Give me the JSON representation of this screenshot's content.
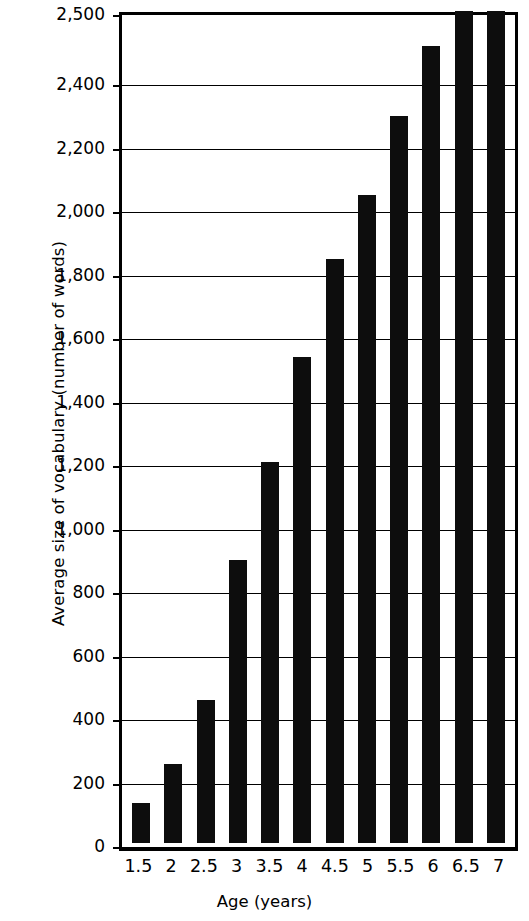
{
  "chart_data": {
    "type": "bar",
    "title": "",
    "subtitle": "",
    "xlabel": "Age (years)",
    "ylabel": "Average size of vocabulary (number of words)",
    "categories": [
      "1.5",
      "2",
      "2.5",
      "3",
      "3.5",
      "4",
      "4.5",
      "5",
      "5.5",
      "6",
      "6.5",
      "7"
    ],
    "values": [
      125,
      250,
      450,
      890,
      1200,
      1530,
      1840,
      2040,
      2290,
      2450,
      2500,
      2500
    ],
    "series": [
      {
        "name": "Average size of vocabulary",
        "values": [
          125,
          250,
          450,
          890,
          1200,
          1530,
          1840,
          2040,
          2290,
          2450,
          2500,
          2500
        ]
      }
    ],
    "ylim": [
      0,
      2500
    ],
    "xlim_note": "categorical",
    "ytick_labels": [
      "0",
      "200",
      "400",
      "600",
      "800",
      "1,000",
      "1,200",
      "1,400",
      "1,600",
      "1,800",
      "2,000",
      "2,200",
      "2,400",
      "2,500"
    ],
    "ytick_values": [
      0,
      200,
      400,
      600,
      800,
      1000,
      1200,
      1400,
      1600,
      1800,
      2000,
      2200,
      2400,
      2500
    ],
    "grid": true,
    "grid_axis": "y",
    "legend": false,
    "legend_position": "none",
    "bar_color": "#0d0d0d",
    "axis_color": "#000000",
    "background_color": "#ffffff",
    "annotations": []
  }
}
